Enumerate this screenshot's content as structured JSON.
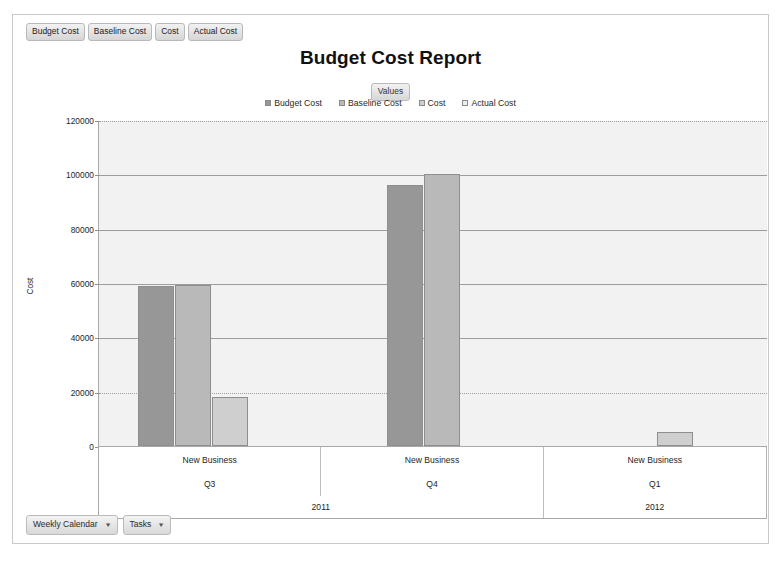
{
  "window": {
    "title": "Budget Cost Report"
  },
  "field_bar": {
    "items": [
      {
        "label": "Budget Cost",
        "name": "field-chip-budget-cost"
      },
      {
        "label": "Baseline Cost",
        "name": "field-chip-baseline-cost"
      },
      {
        "label": "Cost",
        "name": "field-chip-cost"
      },
      {
        "label": "Actual Cost",
        "name": "field-chip-actual-cost"
      }
    ]
  },
  "values_chip": {
    "label": "Values"
  },
  "bottom_bar": {
    "items": [
      {
        "label": "Weekly Calendar",
        "caret": "▼",
        "name": "dropdown-weekly-calendar"
      },
      {
        "label": "Tasks",
        "caret": "▼",
        "name": "dropdown-tasks"
      }
    ]
  },
  "chart_data": {
    "type": "bar",
    "title": "Budget Cost Report",
    "xlabel": "",
    "ylabel": "Cost",
    "ylim": [
      0,
      120000
    ],
    "yticks": [
      0,
      20000,
      40000,
      60000,
      80000,
      100000,
      120000
    ],
    "ytick_labels": [
      "0",
      "20000",
      "40000",
      "60000",
      "80000",
      "100000",
      "120000"
    ],
    "grid": true,
    "legend_position": "top",
    "legend_title": "Values",
    "categories": [
      "New Business",
      "New Business",
      "New Business"
    ],
    "category_levels": [
      {
        "name": "project",
        "labels": [
          "New Business",
          "New Business",
          "New Business"
        ]
      },
      {
        "name": "quarter",
        "labels": [
          "Q3",
          "Q4",
          "Q1"
        ]
      },
      {
        "name": "year",
        "labels": [
          "2011",
          "2011",
          "2012"
        ],
        "spans": [
          2,
          1
        ]
      }
    ],
    "year_groups": [
      {
        "label": "2011",
        "span": 2
      },
      {
        "label": "2012",
        "span": 1
      }
    ],
    "series": [
      {
        "name": "Budget Cost",
        "color": "#979797",
        "values": [
          59000,
          96000,
          null
        ]
      },
      {
        "name": "Baseline Cost",
        "color": "#b9b9b9",
        "values": [
          59200,
          100000,
          null
        ]
      },
      {
        "name": "Cost",
        "color": "#cfcfcf",
        "values": [
          18000,
          null,
          5000
        ]
      },
      {
        "name": "Actual Cost",
        "color": "#eeeeee",
        "values": [
          null,
          null,
          null
        ]
      }
    ]
  },
  "colors": {
    "plot_background": "#f2f2f2",
    "gridline": "#9d9d9d",
    "axis": "#a9a9a9",
    "bar_border": "#8e8e8e",
    "frame": "#c8c8c8"
  }
}
